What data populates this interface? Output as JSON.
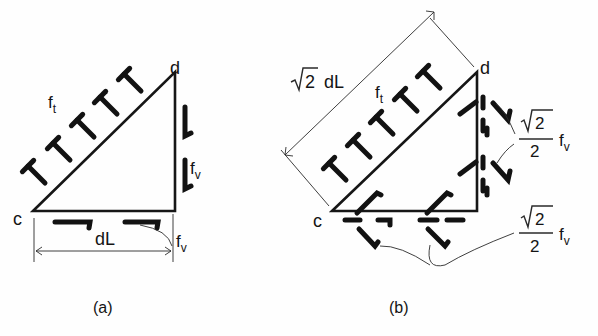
{
  "figure": {
    "panels": [
      {
        "id": "a",
        "caption": "(a)",
        "vertex_c": "c",
        "vertex_d": "d",
        "hypotenuse_stress": "f",
        "hypotenuse_stress_sub": "t",
        "side_stress": "f",
        "side_stress_sub": "v",
        "bottom_stress": "f",
        "bottom_stress_sub": "v",
        "dimension": "dL"
      },
      {
        "id": "b",
        "caption": "(b)",
        "vertex_c": "c",
        "vertex_d": "d",
        "hypotenuse_stress": "f",
        "hypotenuse_stress_sub": "t",
        "hypotenuse_dimension_root": "2",
        "hypotenuse_dimension_rest": "dL",
        "component_top": {
          "num_root": "2",
          "den": "2",
          "symbol": "f",
          "sub": "v"
        },
        "component_bottom": {
          "num_root": "2",
          "den": "2",
          "symbol": "f",
          "sub": "v"
        }
      }
    ]
  }
}
